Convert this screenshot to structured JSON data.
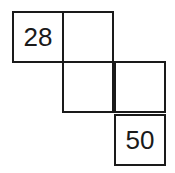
{
  "diagram": {
    "type": "number-grid-staircase",
    "cells": [
      {
        "row": 0,
        "col": 0,
        "value": "28"
      },
      {
        "row": 0,
        "col": 1,
        "value": ""
      },
      {
        "row": 1,
        "col": 1,
        "value": ""
      },
      {
        "row": 1,
        "col": 2,
        "value": ""
      },
      {
        "row": 2,
        "col": 2,
        "value": "50"
      }
    ],
    "colors": {
      "line": "#1a1a1a",
      "background": "#ffffff"
    }
  }
}
